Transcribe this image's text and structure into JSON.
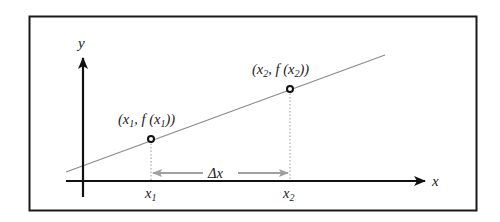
{
  "diagram": {
    "axes": {
      "x_label": "x",
      "y_label": "y"
    },
    "points": [
      {
        "name": "point-1",
        "label_open": "(x",
        "label_sub": "1",
        "label_mid": ", f (x",
        "label_sub2": "1",
        "label_close": "))",
        "tick_label": "x",
        "tick_sub": "1"
      },
      {
        "name": "point-2",
        "label_open": "(x",
        "label_sub": "2",
        "label_mid": ", f (x",
        "label_sub2": "2",
        "label_close": "))",
        "tick_label": "x",
        "tick_sub": "2"
      }
    ],
    "delta": {
      "label": "Δx"
    },
    "colors": {
      "frame": "#1a1a1a",
      "axes": "#111111",
      "line": "#8a8a8a",
      "delta_arrow": "#a0a0a0",
      "dotted": "#9a9a9a",
      "point_fill": "#111111"
    }
  }
}
